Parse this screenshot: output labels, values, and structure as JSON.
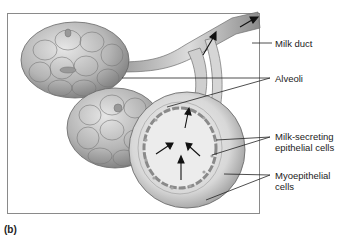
{
  "figure": {
    "panel_label": "(b)",
    "labels": {
      "milk_duct": "Milk duct",
      "alveoli": "Alveoli",
      "milk_secreting_line1": "Milk-secreting",
      "milk_secreting_line2": "epithelial cells",
      "myoepithelial_line1": "Myoepithelial",
      "myoepithelial_line2": "cells"
    },
    "colors": {
      "tissue_light": "#d9d9d9",
      "tissue_mid": "#a8a8a8",
      "tissue_dark": "#6e6e6e",
      "leader_line": "#222222",
      "frame": "#8a8a8a"
    }
  }
}
